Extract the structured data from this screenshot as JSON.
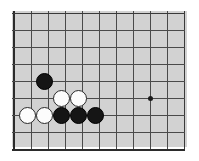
{
  "diagram": {
    "kind": "go-board-corner-diagram",
    "board_background_color": "#d2d2d2",
    "grid_line_color": "#4a4a4a",
    "border_line_color": "#2b2b2b",
    "black_stone_color": "#151515",
    "white_stone_color": "#fcfcfc",
    "page_background_color": "#ffffff",
    "grid": {
      "columns": 11,
      "rows": 9,
      "spacing_px": 17,
      "origin_x_px": 14,
      "origin_y_px": 13,
      "thick_edges": [
        "left",
        "bottom"
      ]
    },
    "star_points": [
      {
        "name": "hoshi",
        "col": 9,
        "row": 6,
        "x": 150,
        "y": 98
      }
    ],
    "stones": [
      {
        "name": "black-stone-1",
        "color": "black",
        "col": 3,
        "row": 5,
        "x": 44,
        "y": 81
      },
      {
        "name": "white-stone-1",
        "color": "white",
        "col": 4,
        "row": 6,
        "x": 61,
        "y": 98
      },
      {
        "name": "white-stone-2",
        "color": "white",
        "col": 5,
        "row": 6,
        "x": 78,
        "y": 98
      },
      {
        "name": "white-stone-3",
        "color": "white",
        "col": 2,
        "row": 7,
        "x": 27,
        "y": 115
      },
      {
        "name": "white-stone-4",
        "color": "white",
        "col": 3,
        "row": 7,
        "x": 44,
        "y": 115
      },
      {
        "name": "black-stone-2",
        "color": "black",
        "col": 4,
        "row": 7,
        "x": 61,
        "y": 115
      },
      {
        "name": "black-stone-3",
        "color": "black",
        "col": 5,
        "row": 7,
        "x": 78,
        "y": 115
      },
      {
        "name": "black-stone-4",
        "color": "black",
        "col": 6,
        "row": 7,
        "x": 95,
        "y": 115
      }
    ]
  }
}
